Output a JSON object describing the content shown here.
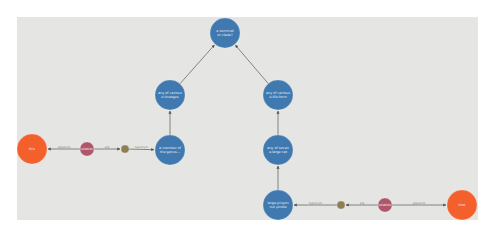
{
  "graph": {
    "background": "#e5e5e3",
    "colors": {
      "concept": "#3f79b0",
      "entity": "#f4602b",
      "relation": "#b0566b",
      "connector": "#8f7d55",
      "edge": "#6a6a6a"
    },
    "nodes": [
      {
        "id": "top",
        "type": "concept",
        "cx": 225,
        "cy": 33,
        "r": 15,
        "lines": [
          "a terminal",
          "or clade?"
        ]
      },
      {
        "id": "left-upper",
        "type": "concept",
        "cx": 170,
        "cy": 95,
        "r": 15,
        "lines": [
          "any of various",
          "e.lineages"
        ]
      },
      {
        "id": "left-lower",
        "type": "concept",
        "cx": 170,
        "cy": 150,
        "r": 15,
        "lines": [
          "a member of",
          "the genus..."
        ]
      },
      {
        "id": "right-upper",
        "type": "concept",
        "cx": 278,
        "cy": 95,
        "r": 15,
        "lines": [
          "any of various",
          "e.life-form"
        ]
      },
      {
        "id": "right-mid",
        "type": "concept",
        "cx": 278,
        "cy": 150,
        "r": 15,
        "lines": [
          "any of seven",
          "e.large cat"
        ]
      },
      {
        "id": "right-lower",
        "type": "concept",
        "cx": 278,
        "cy": 205,
        "r": 15,
        "lines": [
          "large pinyon",
          "nut pinole"
        ]
      },
      {
        "id": "left-entity",
        "type": "entity",
        "cx": 32,
        "cy": 149,
        "r": 15,
        "lines": [
          "this"
        ]
      },
      {
        "id": "left-relation",
        "type": "relation",
        "cx": 87,
        "cy": 149,
        "r": 7,
        "lines": [
          "relation"
        ]
      },
      {
        "id": "left-connector",
        "type": "connector",
        "cx": 125,
        "cy": 149,
        "r": 4,
        "lines": []
      },
      {
        "id": "right-connector",
        "type": "connector",
        "cx": 341,
        "cy": 205,
        "r": 4,
        "lines": []
      },
      {
        "id": "right-relation",
        "type": "relation",
        "cx": 385,
        "cy": 205,
        "r": 7,
        "lines": [
          "relation"
        ]
      },
      {
        "id": "right-entity",
        "type": "entity",
        "cx": 462,
        "cy": 205,
        "r": 15,
        "lines": [
          "that"
        ]
      }
    ],
    "edges": [
      {
        "from": "left-upper",
        "to": "top",
        "label": ""
      },
      {
        "from": "right-upper",
        "to": "top",
        "label": ""
      },
      {
        "from": "left-lower",
        "to": "left-upper",
        "label": ""
      },
      {
        "from": "right-mid",
        "to": "right-upper",
        "label": ""
      },
      {
        "from": "right-lower",
        "to": "right-mid",
        "label": ""
      },
      {
        "from": "left-connector",
        "to": "left-lower",
        "label": "hypernym"
      },
      {
        "from": "left-relation",
        "to": "left-connector",
        "label": "arg"
      },
      {
        "from": "left-relation",
        "to": "left-entity",
        "label": "argument"
      },
      {
        "from": "right-connector",
        "to": "right-lower",
        "label": "hypernym"
      },
      {
        "from": "right-relation",
        "to": "right-connector",
        "label": "arg"
      },
      {
        "from": "right-relation",
        "to": "right-entity",
        "label": "argument"
      }
    ]
  }
}
